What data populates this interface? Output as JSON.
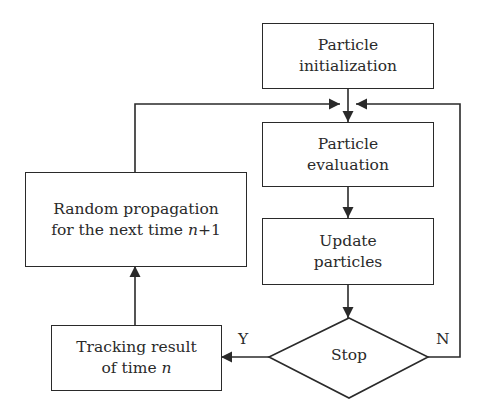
{
  "diagram": {
    "type": "flowchart",
    "colors": {
      "stroke": "#2a2a2a",
      "background": "#ffffff"
    },
    "nodes": {
      "init": {
        "line1": "Particle",
        "line2": "initialization"
      },
      "evaluation": {
        "line1": "Particle",
        "line2": "evaluation"
      },
      "update": {
        "line1": "Update",
        "line2": "particles"
      },
      "stop": {
        "label": "Stop"
      },
      "tracking": {
        "line1": "Tracking result",
        "line2_prefix": "of time ",
        "line2_var": "n"
      },
      "propagation": {
        "line1": "Random propagation",
        "line2_prefix": "for the next time ",
        "line2_var": "n",
        "line2_suffix": "+1"
      }
    },
    "edges": [
      {
        "from": "init",
        "to": "evaluation",
        "label": ""
      },
      {
        "from": "evaluation",
        "to": "update",
        "label": ""
      },
      {
        "from": "update",
        "to": "stop",
        "label": ""
      },
      {
        "from": "stop",
        "to": "tracking",
        "label": "Y"
      },
      {
        "from": "stop",
        "to": "evaluation",
        "label": "N"
      },
      {
        "from": "tracking",
        "to": "propagation",
        "label": ""
      },
      {
        "from": "propagation",
        "to": "evaluation",
        "label": ""
      }
    ],
    "edge_labels": {
      "yes": "Y",
      "no": "N"
    }
  }
}
